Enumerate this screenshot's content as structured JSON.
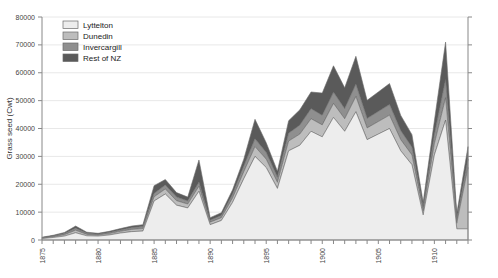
{
  "chart_data": {
    "type": "area",
    "stacked": true,
    "title": "",
    "xlabel": "",
    "ylabel": "Grass seed (Cwt)",
    "ylim": [
      0,
      80000
    ],
    "ytick_step": 10000,
    "yticks": [
      "0",
      "10000",
      "20000",
      "30000",
      "40000",
      "50000",
      "60000",
      "70000",
      "80000"
    ],
    "xlim": [
      1875,
      1913
    ],
    "xtick_step": 1,
    "xlabel_step": 5,
    "xtick_labels": [
      "1875",
      "1880",
      "1885",
      "1890",
      "1895",
      "1900",
      "1905",
      "1910"
    ],
    "grid": "horizontal",
    "legend_position": "top-left",
    "colors": {
      "Lyttelton": "#ededed",
      "Dunedin": "#bdbdbd",
      "Invercargill": "#8f8f8f",
      "Rest of NZ": "#5a5a5a",
      "outline": "#6b6b6b",
      "grid": "#e8e8e8",
      "axis": "#888888"
    },
    "x": [
      1875,
      1876,
      1877,
      1878,
      1879,
      1880,
      1881,
      1882,
      1883,
      1884,
      1885,
      1886,
      1887,
      1888,
      1889,
      1890,
      1891,
      1892,
      1893,
      1894,
      1895,
      1896,
      1897,
      1898,
      1899,
      1900,
      1901,
      1902,
      1903,
      1904,
      1905,
      1906,
      1907,
      1908,
      1909,
      1910,
      1911,
      1912,
      1913
    ],
    "series": [
      {
        "name": "Lyttelton",
        "values": [
          500,
          900,
          1400,
          2600,
          1500,
          1400,
          1800,
          2500,
          3000,
          3200,
          14000,
          16500,
          12500,
          11500,
          17500,
          5500,
          7000,
          13500,
          22000,
          30000,
          26000,
          18500,
          32000,
          34000,
          39000,
          37000,
          44000,
          39000,
          46000,
          36000,
          38000,
          40000,
          32000,
          27000,
          9000,
          30500,
          43000,
          4000,
          4000
        ]
      },
      {
        "name": "Dunedin",
        "values": [
          200,
          300,
          500,
          900,
          500,
          400,
          500,
          600,
          800,
          900,
          1500,
          1800,
          1600,
          1400,
          1800,
          900,
          1000,
          1600,
          2500,
          3500,
          3000,
          2200,
          3500,
          4000,
          4500,
          4300,
          5000,
          4500,
          5500,
          4200,
          4500,
          4800,
          4000,
          3500,
          1500,
          4000,
          8000,
          2000,
          22000
        ]
      },
      {
        "name": "Invercargill",
        "values": [
          150,
          250,
          400,
          700,
          400,
          300,
          400,
          500,
          600,
          700,
          1200,
          1400,
          1300,
          1100,
          1400,
          700,
          800,
          1300,
          2000,
          2800,
          2400,
          1800,
          2800,
          3200,
          3600,
          3400,
          4000,
          3600,
          4400,
          3400,
          3600,
          3800,
          3200,
          2800,
          1200,
          3200,
          6500,
          1500,
          3000
        ]
      },
      {
        "name": "Rest of NZ",
        "values": [
          150,
          250,
          400,
          800,
          400,
          300,
          400,
          500,
          600,
          700,
          2800,
          2000,
          1600,
          1400,
          8000,
          900,
          1000,
          1600,
          2500,
          7000,
          3500,
          2200,
          4500,
          5500,
          6000,
          8000,
          9500,
          7500,
          10000,
          6500,
          7000,
          7500,
          5500,
          4500,
          1800,
          5000,
          13500,
          2000,
          4500
        ]
      }
    ]
  },
  "legend": {
    "items": [
      {
        "label": "Lyttelton"
      },
      {
        "label": "Dunedin"
      },
      {
        "label": "Invercargill"
      },
      {
        "label": "Rest of NZ"
      }
    ]
  }
}
